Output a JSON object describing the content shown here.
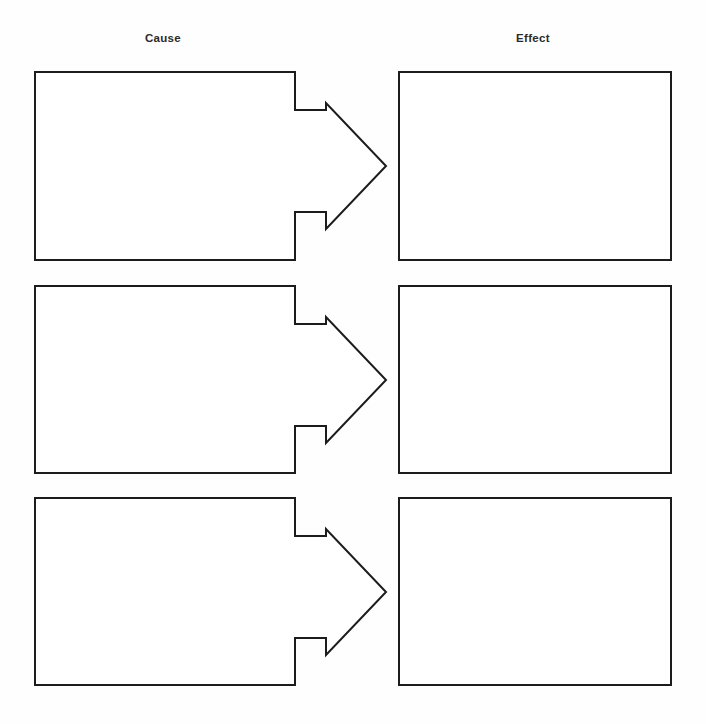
{
  "page": {
    "background_color": "#fefefe",
    "stroke_color": "#1c1c1c",
    "fill_color": "#ffffff",
    "text_color": "#2b2b2b",
    "width": 706,
    "height": 724
  },
  "headings": {
    "cause": "Cause",
    "effect": "Effect"
  },
  "rows": [
    {
      "row_number": "1",
      "cause": {
        "value": "",
        "placeholder": ""
      },
      "arrow": {
        "icon": "arrow-right-icon",
        "direction": "right"
      },
      "effect": {
        "value": "",
        "placeholder": ""
      }
    },
    {
      "row_number": "2",
      "cause": {
        "value": "",
        "placeholder": ""
      },
      "arrow": {
        "icon": "arrow-right-icon",
        "direction": "right"
      },
      "effect": {
        "value": "",
        "placeholder": ""
      }
    },
    {
      "row_number": "3",
      "cause": {
        "value": "",
        "placeholder": ""
      },
      "arrow": {
        "icon": "arrow-right-icon",
        "direction": "right"
      },
      "effect": {
        "value": "",
        "placeholder": ""
      }
    }
  ]
}
